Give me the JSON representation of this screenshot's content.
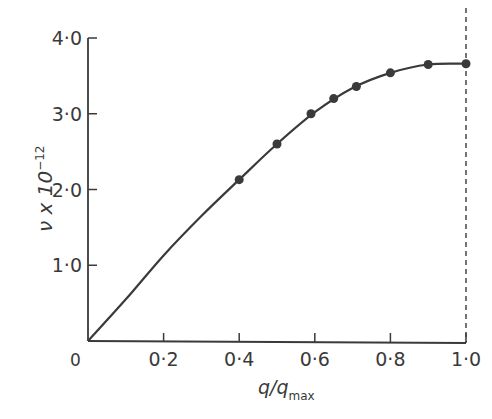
{
  "chart_data": {
    "type": "line",
    "title": "",
    "xlabel": "q/q",
    "xlabel_subscript": "max",
    "ylabel": "ν x 10",
    "ylabel_superscript": "−12",
    "xlim": [
      0,
      1.0
    ],
    "ylim": [
      0,
      4.0
    ],
    "grid": false,
    "legend": null,
    "x_ticks": [
      0,
      0.2,
      0.4,
      0.6,
      0.8,
      1.0
    ],
    "x_tick_labels": [
      "0",
      "0·2",
      "0·4",
      "0·6",
      "0·8",
      "1·0"
    ],
    "y_ticks": [
      1.0,
      2.0,
      3.0,
      4.0
    ],
    "y_tick_labels": [
      "1·0",
      "2·0",
      "3·0",
      "4·0"
    ],
    "origin_label": "0",
    "annotations": [
      {
        "type": "vertical-dashed-line",
        "x": 1.0
      }
    ],
    "series": [
      {
        "name": "curve",
        "style": "smooth-line",
        "x": [
          0,
          0.1,
          0.2,
          0.3,
          0.4,
          0.5,
          0.6,
          0.7,
          0.8,
          0.9,
          1.0
        ],
        "y": [
          0,
          0.55,
          1.13,
          1.65,
          2.13,
          2.6,
          3.02,
          3.34,
          3.54,
          3.65,
          3.66
        ]
      },
      {
        "name": "measured-points",
        "style": "markers",
        "x": [
          0.4,
          0.5,
          0.59,
          0.65,
          0.71,
          0.8,
          0.9,
          1.0
        ],
        "y": [
          2.13,
          2.6,
          3.0,
          3.2,
          3.36,
          3.54,
          3.65,
          3.66
        ]
      }
    ]
  },
  "colors": {
    "ink": "#3a3a3a",
    "background": "#ffffff"
  }
}
